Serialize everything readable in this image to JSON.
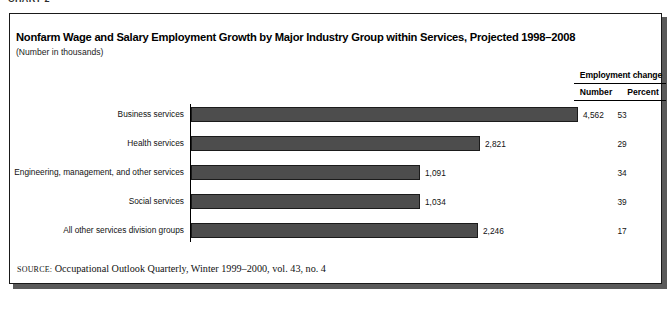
{
  "top_caption": "CHART 2",
  "figure": {
    "title": "Nonfarm Wage and Salary Employment Growth by Major Industry Group within Services, Projected 1998–2008",
    "subtitle": "(Number in thousands)",
    "source_label": "SOURCE:",
    "source_text": "Occupational Outlook Quarterly, Winter 1999–2000, vol. 43, no. 4"
  },
  "legend": {
    "title": "Employment  change",
    "col_number": "Number",
    "col_percent": "Percent"
  },
  "colors": {
    "bar_fill": "#4d4d4d",
    "bar_border": "#1b1b1b",
    "frame_border": "#1a1a1a",
    "shadow": "#5a5a5a",
    "background": "#ffffff"
  },
  "chart_data": {
    "type": "bar",
    "orientation": "horizontal",
    "title": "Nonfarm Wage and Salary Employment Growth by Major Industry Group within Services, Projected 1998–2008",
    "subtitle": "(Number in thousands)",
    "xlabel": "",
    "ylabel": "",
    "grid": false,
    "legend_position": "top-right",
    "value_unit": "thousands",
    "categories": [
      "Business services",
      "Health services",
      "Engineering, management, and other services",
      "Social services",
      "All other services division groups"
    ],
    "series": [
      {
        "name": "Number",
        "values": [
          4562,
          2821,
          1091,
          1034,
          2246
        ],
        "labels": [
          "4,562",
          "2,821",
          "1,091",
          "1,034",
          "2,246"
        ]
      },
      {
        "name": "Percent",
        "values": [
          53,
          29,
          34,
          39,
          17
        ],
        "labels": [
          "53",
          "29",
          "34",
          "39",
          "17"
        ]
      }
    ],
    "bar_pixel_widths": [
      387,
      289,
      229,
      229,
      287
    ],
    "bar_top_offsets": [
      107,
      136,
      165,
      194,
      223
    ],
    "note": "Rendered bar lengths in the source scan are not strictly proportional to the Number values."
  }
}
